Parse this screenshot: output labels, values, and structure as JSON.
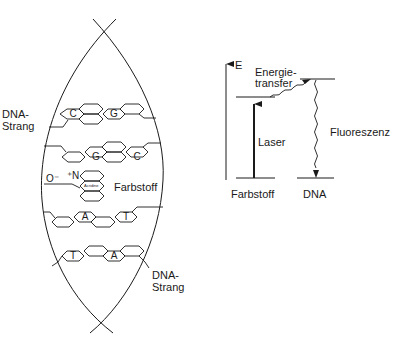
{
  "left_panel": {
    "strand_label_top": "DNA-\nStrang",
    "strand_label_bottom": "DNA-\nStrang",
    "dye_label": "Farbstoff",
    "oxygen_label": "O⁻",
    "nitrogen_label": "⁺N",
    "acridine_label": "Acridine",
    "base_pairs": [
      {
        "left": "C",
        "right": "G"
      },
      {
        "left": "G",
        "right": "C"
      },
      {
        "left": "A",
        "right": "T"
      },
      {
        "left": "T",
        "right": "A"
      }
    ]
  },
  "right_panel": {
    "axis_label": "E",
    "transfer_label": "Energie-\ntransfer",
    "laser_label": "Laser",
    "fluorescence_label": "Fluoreszenz",
    "dye_level_label": "Farbstoff",
    "dna_level_label": "DNA"
  },
  "colors": {
    "line": "#1a1a1a",
    "background": "#ffffff"
  }
}
